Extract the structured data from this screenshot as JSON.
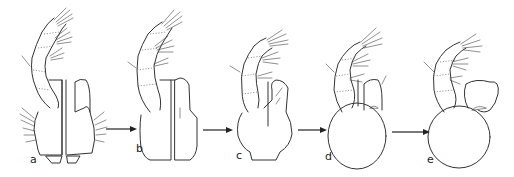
{
  "figure": {
    "type": "morphological series diagram",
    "stages": [
      {
        "id": "a",
        "label": "a",
        "description": "palp with two separate plates and basal pieces"
      },
      {
        "id": "b",
        "label": "b",
        "description": "palp with two elongate plates"
      },
      {
        "id": "c",
        "label": "c",
        "description": "palp with partially fused plates on rounded base"
      },
      {
        "id": "d",
        "label": "d",
        "description": "palp with fused oval base and small lobe"
      },
      {
        "id": "e",
        "label": "e",
        "description": "palp with rounded base and expanded lobe"
      }
    ],
    "arrows": [
      {
        "from": "a",
        "to": "b"
      },
      {
        "from": "b",
        "to": "c"
      },
      {
        "from": "c",
        "to": "d"
      },
      {
        "from": "d",
        "to": "e"
      }
    ],
    "colors": {
      "background": "#ffffff",
      "line": "#333333"
    }
  }
}
